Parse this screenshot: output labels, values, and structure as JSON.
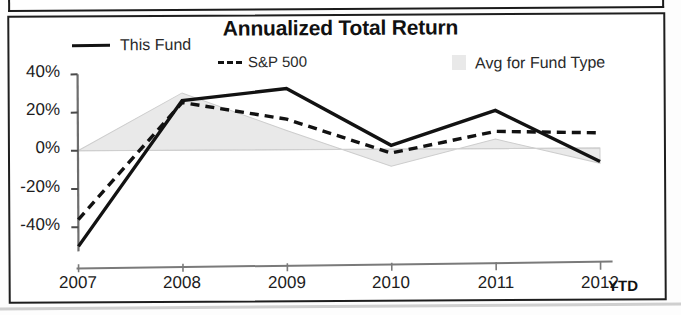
{
  "chart_data": {
    "type": "line",
    "title": "Annualized Total Return",
    "xlabel": "",
    "ylabel": "",
    "categories": [
      "2007",
      "2008",
      "2009",
      "2010",
      "2011",
      "2012"
    ],
    "x_axis_suffix": "YTD",
    "ylim": [
      -50,
      40
    ],
    "ytick_values": [
      40,
      20,
      0,
      -20,
      -40
    ],
    "ytick_labels": [
      "40%",
      "20%",
      "0%",
      "-20%",
      "-40%"
    ],
    "grid": false,
    "legend_position": "top",
    "series": [
      {
        "name": "This Fund",
        "style": "solid",
        "color": "#121212",
        "values": [
          -50,
          26,
          32,
          2,
          20,
          -7
        ]
      },
      {
        "name": "S&P 500",
        "style": "dashed",
        "color": "#121212",
        "values": [
          -36,
          25,
          16,
          -2,
          9,
          8
        ]
      },
      {
        "name": "Avg for Fund Type",
        "style": "filled-area",
        "color": "#e9e9e9",
        "values": [
          0,
          30,
          10,
          -9,
          5,
          -8
        ]
      }
    ]
  },
  "legend": {
    "items": [
      {
        "label": "This Fund",
        "marker": "solid-line-swatch"
      },
      {
        "label": "S&P 500",
        "marker": "dashed-line-swatch"
      },
      {
        "label": "Avg for Fund Type",
        "marker": "area-swatch"
      }
    ]
  },
  "axis": {
    "y_labels": [
      "40%",
      "20%",
      "0%",
      "-20%",
      "-40%"
    ],
    "x_labels": [
      "2007",
      "2008",
      "2009",
      "2010",
      "2011",
      "2012"
    ],
    "x_suffix": "YTD"
  }
}
